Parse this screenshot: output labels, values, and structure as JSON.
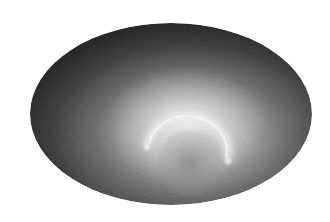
{
  "image": {
    "description": "Grayscale elliptical all-sky projection with a bright glowing arc",
    "colors": {
      "background": "#ffffff",
      "edge": "#0a0a0a",
      "mid": "#6a6a6a",
      "glow": "#f4f4f4",
      "arc": "#ffffff"
    }
  }
}
